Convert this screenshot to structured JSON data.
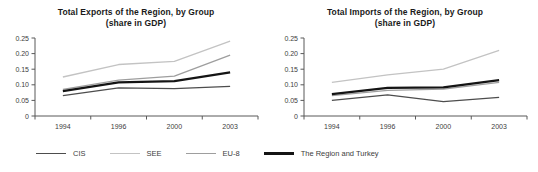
{
  "page": {
    "background": "#ffffff",
    "text_color": "#404040",
    "axis_color": "#595959"
  },
  "legend": {
    "items": [
      {
        "label": "CIS",
        "color": "#4d4d4d",
        "thickness": 1.3
      },
      {
        "label": "SEE",
        "color": "#c3c3c3",
        "thickness": 1.3
      },
      {
        "label": "EU-8",
        "color": "#9e9e9e",
        "thickness": 1.3
      },
      {
        "label": "The Region and Turkey",
        "color": "#141414",
        "thickness": 2.2
      }
    ]
  },
  "chart_data": [
    {
      "type": "line",
      "title": "Total Exports of the Region, by Group",
      "subtitle": "(share in GDP)",
      "categories": [
        "1994",
        "1996",
        "2000",
        "2003"
      ],
      "xlabel": "",
      "ylabel": "",
      "ylim": [
        0,
        0.25
      ],
      "ytick_step": 0.05,
      "ytick_labels": [
        "0",
        "0.05",
        "0.10",
        "0.15",
        "0.20",
        "0.25"
      ],
      "grid": false,
      "legend_position": "bottom",
      "series": [
        {
          "name": "CIS",
          "values": [
            0.065,
            0.09,
            0.088,
            0.095
          ],
          "color": "#4d4d4d",
          "width": 1.3
        },
        {
          "name": "SEE",
          "values": [
            0.125,
            0.165,
            0.175,
            0.24
          ],
          "color": "#c3c3c3",
          "width": 1.3
        },
        {
          "name": "EU-8",
          "values": [
            0.085,
            0.115,
            0.128,
            0.195
          ],
          "color": "#9e9e9e",
          "width": 1.3
        },
        {
          "name": "The Region and Turkey",
          "values": [
            0.08,
            0.108,
            0.112,
            0.14
          ],
          "color": "#141414",
          "width": 2.2
        }
      ]
    },
    {
      "type": "line",
      "title": "Total Imports of the Region, by Group",
      "subtitle": "(share in GDP)",
      "categories": [
        "1994",
        "1996",
        "2000",
        "2003"
      ],
      "xlabel": "",
      "ylabel": "",
      "ylim": [
        0,
        0.25
      ],
      "ytick_step": 0.05,
      "ytick_labels": [
        "0",
        "0.05",
        "0.10",
        "0.15",
        "0.20",
        "0.25"
      ],
      "grid": false,
      "legend_position": "none",
      "series": [
        {
          "name": "CIS",
          "values": [
            0.05,
            0.068,
            0.046,
            0.06
          ],
          "color": "#4d4d4d",
          "width": 1.3
        },
        {
          "name": "SEE",
          "values": [
            0.108,
            0.132,
            0.15,
            0.21
          ],
          "color": "#c3c3c3",
          "width": 1.3
        },
        {
          "name": "EU-8",
          "values": [
            0.065,
            0.082,
            0.086,
            0.108
          ],
          "color": "#9e9e9e",
          "width": 1.3
        },
        {
          "name": "The Region and Turkey",
          "values": [
            0.07,
            0.09,
            0.092,
            0.115
          ],
          "color": "#141414",
          "width": 2.2
        }
      ]
    }
  ]
}
